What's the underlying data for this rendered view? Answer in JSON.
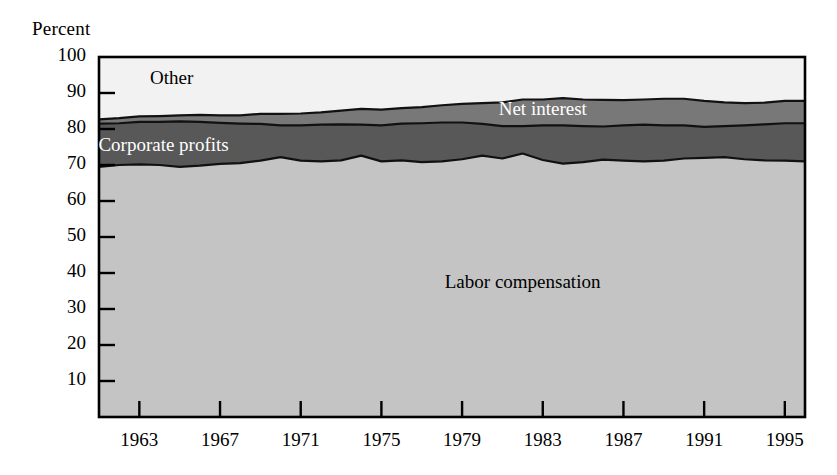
{
  "chart_data": {
    "type": "area",
    "stacked": true,
    "title": "",
    "xlabel": "",
    "ylabel": "Percent",
    "ylim": [
      0,
      100
    ],
    "xlim": [
      1961,
      1996
    ],
    "yticks": [
      10,
      20,
      30,
      40,
      50,
      60,
      70,
      80,
      90,
      100
    ],
    "xticks": [
      1963,
      1967,
      1971,
      1975,
      1979,
      1983,
      1987,
      1991,
      1995
    ],
    "grid": false,
    "legend_position": "inline-labels",
    "x": [
      1961,
      1962,
      1963,
      1964,
      1965,
      1966,
      1967,
      1968,
      1969,
      1970,
      1971,
      1972,
      1973,
      1974,
      1975,
      1976,
      1977,
      1978,
      1979,
      1980,
      1981,
      1982,
      1983,
      1984,
      1985,
      1986,
      1987,
      1988,
      1989,
      1990,
      1991,
      1992,
      1993,
      1994,
      1995,
      1996
    ],
    "series": [
      {
        "name": "Labor compensation",
        "color": "#c4c4c4",
        "label_color": "#000000",
        "values": [
          69.5,
          70.0,
          70.2,
          70.0,
          69.5,
          69.8,
          70.3,
          70.5,
          71.2,
          72.2,
          71.2,
          71.0,
          71.3,
          72.6,
          71.0,
          71.3,
          70.8,
          71.0,
          71.6,
          72.6,
          71.8,
          73.2,
          71.4,
          70.4,
          70.8,
          71.5,
          71.2,
          71.0,
          71.2,
          71.8,
          72.0,
          72.2,
          71.6,
          71.3,
          71.2,
          71.0
        ]
      },
      {
        "name": "Corporate profits",
        "color": "#585858",
        "label_color": "#ffffff",
        "values": [
          12.0,
          11.6,
          11.8,
          12.0,
          12.6,
          12.2,
          11.4,
          11.0,
          10.2,
          8.8,
          9.8,
          10.2,
          10.0,
          8.6,
          10.0,
          10.2,
          10.8,
          10.8,
          10.2,
          8.8,
          9.0,
          7.6,
          9.6,
          10.6,
          10.0,
          9.2,
          9.8,
          10.2,
          9.8,
          9.2,
          8.6,
          8.6,
          9.4,
          10.0,
          10.4,
          10.6
        ]
      },
      {
        "name": "Net interest",
        "color": "#787878",
        "label_color": "#ffffff",
        "values": [
          1.2,
          1.4,
          1.5,
          1.6,
          1.7,
          1.9,
          2.1,
          2.3,
          2.8,
          3.2,
          3.3,
          3.4,
          3.8,
          4.4,
          4.4,
          4.3,
          4.5,
          4.8,
          5.2,
          5.8,
          6.6,
          7.4,
          7.2,
          7.6,
          7.4,
          7.4,
          7.0,
          7.0,
          7.4,
          7.4,
          7.2,
          6.6,
          6.2,
          6.0,
          6.2,
          6.2
        ]
      },
      {
        "name": "Other",
        "color": "#f2f2f2",
        "label_color": "#000000",
        "values": [
          17.3,
          17.0,
          16.5,
          16.4,
          16.2,
          16.1,
          16.2,
          16.2,
          15.8,
          15.8,
          15.7,
          15.4,
          14.9,
          14.4,
          14.6,
          14.2,
          13.9,
          13.4,
          13.0,
          12.8,
          12.6,
          11.8,
          11.8,
          11.4,
          11.8,
          11.9,
          12.0,
          11.8,
          11.6,
          11.6,
          12.2,
          12.6,
          12.8,
          12.7,
          12.2,
          12.2
        ]
      }
    ],
    "annotations": [
      {
        "text": "Other",
        "x": 1964.6,
        "y": 93.5,
        "color": "dark"
      },
      {
        "text": "Net interest",
        "x": 1983.0,
        "y": 85.0,
        "color": "light"
      },
      {
        "text": "Corporate profits",
        "x": 1964.2,
        "y": 75.0,
        "color": "light"
      },
      {
        "text": "Labor compensation",
        "x": 1982.0,
        "y": 37.0,
        "color": "dark"
      }
    ]
  },
  "axes": {
    "y_title": "Percent",
    "y_tick_labels": [
      "100",
      "90",
      "80",
      "70",
      "60",
      "50",
      "40",
      "30",
      "20",
      "10"
    ],
    "x_tick_labels": [
      "1963",
      "1967",
      "1971",
      "1975",
      "1979",
      "1983",
      "1987",
      "1991",
      "1995"
    ]
  }
}
